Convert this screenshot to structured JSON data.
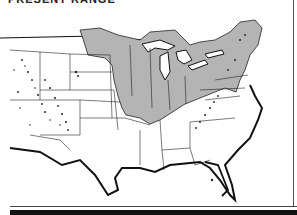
{
  "map": {
    "title": "PRESENT RANGE",
    "subject": "United States map with shaded distribution range",
    "colors": {
      "range_fill": "#b4b4b4",
      "outline": "#111111",
      "background": "#ffffff",
      "scattered_populations": "#222222"
    },
    "legend": [
      {
        "label": "Shaded area: continuous range (eastern/midwestern states, Great Lakes region, New England)"
      },
      {
        "label": "Speckled dots: scattered mountain populations (Rocky Mountains, Appalachians)"
      }
    ]
  }
}
